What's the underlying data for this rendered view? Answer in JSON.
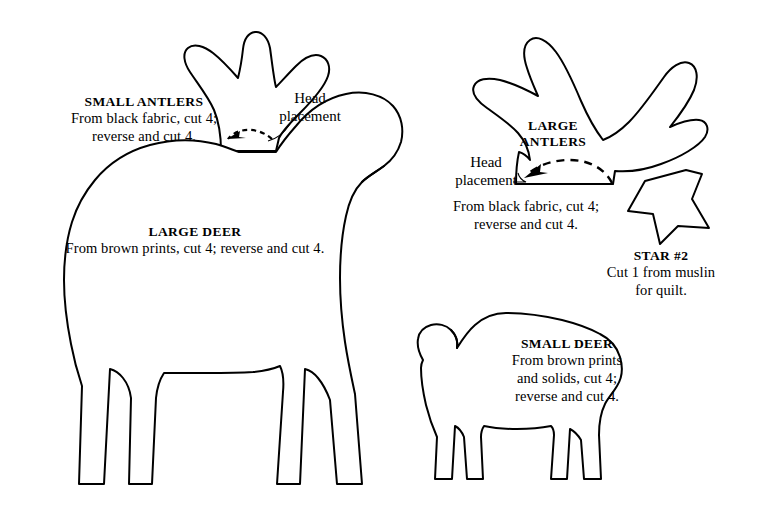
{
  "page": {
    "kind": "quilting-pattern-template-sheet",
    "background_color": "#ffffff",
    "ink_color": "#000000",
    "width": 758,
    "height": 514
  },
  "labels": {
    "small_antlers": {
      "title": "SMALL ANTLERS",
      "line1": "From black fabric, cut 4;",
      "line2": "reverse and cut 4."
    },
    "large_deer": {
      "title": "LARGE DEER",
      "line1": "From brown prints, cut 4; reverse and cut 4."
    },
    "large_antlers": {
      "title_line1": "LARGE",
      "title_line2": "ANTLERS",
      "line1": "From black fabric, cut 4;",
      "line2": "reverse and cut 4."
    },
    "star": {
      "title": "STAR #2",
      "line1": "Cut 1 from muslin",
      "line2": "for quilt."
    },
    "small_deer": {
      "title": "SMALL DEER",
      "line1": "From brown prints",
      "line2": "and solids, cut 4;",
      "line3": "reverse and cut 4."
    }
  },
  "callouts": {
    "head_placement_small": {
      "line1": "Head",
      "line2": "placement"
    },
    "head_placement_large": {
      "line1": "Head",
      "line2": "placement"
    }
  },
  "shapes": {
    "small_antlers": {
      "name": "small-antlers-pattern-piece"
    },
    "large_antlers": {
      "name": "large-antlers-pattern-piece"
    },
    "large_deer": {
      "name": "large-deer-pattern-piece"
    },
    "small_deer": {
      "name": "small-deer-pattern-piece"
    },
    "star_2": {
      "name": "star-2-pattern-piece",
      "points": 5
    }
  }
}
